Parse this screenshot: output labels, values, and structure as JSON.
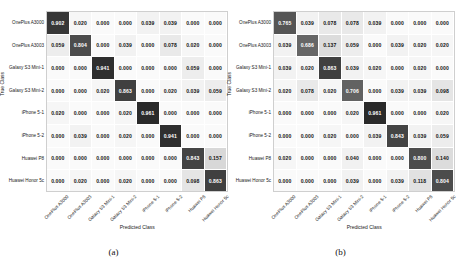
{
  "figure": {
    "panels": [
      {
        "caption": "(a)",
        "xlabel": "Predicted Class",
        "ylabel": "True Class",
        "classes": [
          "OnePlus A3000",
          "OnePlus A3003",
          "Galaxy S3 Mini-1",
          "Galaxy S3 Mini-2",
          "iPhone 5-1",
          "iPhone 5-2",
          "Huawei P8",
          "Huawei Honor 5c"
        ],
        "rows": [
          [
            0.902,
            0.02,
            0.0,
            0.0,
            0.039,
            0.039,
            0.0,
            0.0
          ],
          [
            0.059,
            0.804,
            0.0,
            0.039,
            0.0,
            0.078,
            0.02,
            0.0
          ],
          [
            0.0,
            0.0,
            0.941,
            0.0,
            0.0,
            0.0,
            0.059,
            0.0
          ],
          [
            0.0,
            0.0,
            0.02,
            0.863,
            0.0,
            0.02,
            0.039,
            0.059
          ],
          [
            0.02,
            0.0,
            0.0,
            0.02,
            0.961,
            0.0,
            0.0,
            0.0
          ],
          [
            0.0,
            0.039,
            0.0,
            0.02,
            0.0,
            0.941,
            0.0,
            0.0
          ],
          [
            0.0,
            0.0,
            0.0,
            0.0,
            0.0,
            0.0,
            0.843,
            0.157
          ],
          [
            0.0,
            0.02,
            0.0,
            0.02,
            0.0,
            0.0,
            0.098,
            0.863
          ]
        ]
      },
      {
        "caption": "(b)",
        "xlabel": "Predicted Class",
        "ylabel": "True Class",
        "classes": [
          "OnePlus A3000",
          "OnePlus A3003",
          "Galaxy S3 Mini-1",
          "Galaxy S3 Mini-2",
          "iPhone 5-1",
          "iPhone 5-2",
          "Huawei P8",
          "Huawei Honor 5c"
        ],
        "rows": [
          [
            0.765,
            0.039,
            0.078,
            0.078,
            0.039,
            0.0,
            0.0,
            0.0
          ],
          [
            0.039,
            0.686,
            0.137,
            0.059,
            0.0,
            0.039,
            0.02,
            0.02
          ],
          [
            0.039,
            0.02,
            0.863,
            0.039,
            0.02,
            0.0,
            0.02,
            0.0
          ],
          [
            0.02,
            0.078,
            0.02,
            0.706,
            0.0,
            0.039,
            0.039,
            0.098
          ],
          [
            0.0,
            0.0,
            0.0,
            0.02,
            0.961,
            0.0,
            0.0,
            0.02
          ],
          [
            0.0,
            0.0,
            0.02,
            0.0,
            0.039,
            0.843,
            0.039,
            0.059
          ],
          [
            0.02,
            0.0,
            0.0,
            0.04,
            0.0,
            0.0,
            0.8,
            0.14
          ],
          [
            0.0,
            0.0,
            0.0,
            0.039,
            0.0,
            0.039,
            0.118,
            0.804
          ]
        ]
      }
    ]
  },
  "chart_data": [
    {
      "type": "heatmap",
      "title": "(a)",
      "xlabel": "Predicted Class",
      "ylabel": "True Class",
      "x_tick_labels": [
        "OnePlus A3000",
        "OnePlus A3003",
        "Galaxy S3 Mini-1",
        "Galaxy S3 Mini-2",
        "iPhone 5-1",
        "iPhone 5-2",
        "Huawei P8",
        "Huawei Honor 5c"
      ],
      "y_tick_labels": [
        "OnePlus A3000",
        "OnePlus A3003",
        "Galaxy S3 Mini-1",
        "Galaxy S3 Mini-2",
        "iPhone 5-1",
        "iPhone 5-2",
        "Huawei P8",
        "Huawei Honor 5c"
      ],
      "values": [
        [
          0.902,
          0.02,
          0.0,
          0.0,
          0.039,
          0.039,
          0.0,
          0.0
        ],
        [
          0.059,
          0.804,
          0.0,
          0.039,
          0.0,
          0.078,
          0.02,
          0.0
        ],
        [
          0.0,
          0.0,
          0.941,
          0.0,
          0.0,
          0.0,
          0.059,
          0.0
        ],
        [
          0.0,
          0.0,
          0.02,
          0.863,
          0.0,
          0.02,
          0.039,
          0.059
        ],
        [
          0.02,
          0.0,
          0.0,
          0.02,
          0.961,
          0.0,
          0.0,
          0.0
        ],
        [
          0.0,
          0.039,
          0.0,
          0.02,
          0.0,
          0.941,
          0.0,
          0.0
        ],
        [
          0.0,
          0.0,
          0.0,
          0.0,
          0.0,
          0.0,
          0.843,
          0.157
        ],
        [
          0.0,
          0.02,
          0.0,
          0.02,
          0.0,
          0.0,
          0.098,
          0.863
        ]
      ],
      "zlim": [
        0,
        1
      ],
      "grid": false,
      "legend": "none"
    },
    {
      "type": "heatmap",
      "title": "(b)",
      "xlabel": "Predicted Class",
      "ylabel": "True Class",
      "x_tick_labels": [
        "OnePlus A3000",
        "OnePlus A3003",
        "Galaxy S3 Mini-1",
        "Galaxy S3 Mini-2",
        "iPhone 5-1",
        "iPhone 5-2",
        "Huawei P8",
        "Huawei Honor 5c"
      ],
      "y_tick_labels": [
        "OnePlus A3000",
        "OnePlus A3003",
        "Galaxy S3 Mini-1",
        "Galaxy S3 Mini-2",
        "iPhone 5-1",
        "iPhone 5-2",
        "Huawei P8",
        "Huawei Honor 5c"
      ],
      "values": [
        [
          0.765,
          0.039,
          0.078,
          0.078,
          0.039,
          0.0,
          0.0,
          0.0
        ],
        [
          0.039,
          0.686,
          0.137,
          0.059,
          0.0,
          0.039,
          0.02,
          0.02
        ],
        [
          0.039,
          0.02,
          0.863,
          0.039,
          0.02,
          0.0,
          0.02,
          0.0
        ],
        [
          0.02,
          0.078,
          0.02,
          0.706,
          0.0,
          0.039,
          0.039,
          0.098
        ],
        [
          0.0,
          0.0,
          0.0,
          0.02,
          0.961,
          0.0,
          0.0,
          0.02
        ],
        [
          0.0,
          0.0,
          0.02,
          0.0,
          0.039,
          0.843,
          0.039,
          0.059
        ],
        [
          0.02,
          0.0,
          0.0,
          0.04,
          0.0,
          0.0,
          0.8,
          0.14
        ],
        [
          0.0,
          0.0,
          0.0,
          0.039,
          0.0,
          0.039,
          0.118,
          0.804
        ]
      ],
      "zlim": [
        0,
        1
      ],
      "grid": false,
      "legend": "none"
    }
  ]
}
